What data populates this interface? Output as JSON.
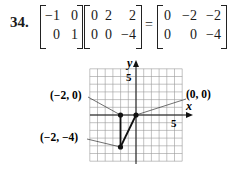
{
  "problem": {
    "number": "34.",
    "matrix_a": [
      [
        "−1",
        "0"
      ],
      [
        "0",
        "1"
      ]
    ],
    "matrix_b": [
      [
        "0",
        "2",
        "2"
      ],
      [
        "0",
        "0",
        "−4"
      ]
    ],
    "equals": "=",
    "matrix_result": [
      [
        "0",
        "−2",
        "−2"
      ],
      [
        "0",
        "0",
        "−4"
      ]
    ]
  },
  "graph": {
    "x_axis_label": "x",
    "y_axis_label": "y",
    "x_tick_label": "5",
    "y_tick_label": "5",
    "grid_range": [
      -6,
      6
    ],
    "points": [
      {
        "label": "(−2, 0)",
        "x": -2,
        "y": 0
      },
      {
        "label": "(0, 0)",
        "x": 0,
        "y": 0
      },
      {
        "label": "(−2, −4)",
        "x": -2,
        "y": -4
      }
    ],
    "grid_color": "#9a9a9a",
    "line_color": "#111111"
  }
}
